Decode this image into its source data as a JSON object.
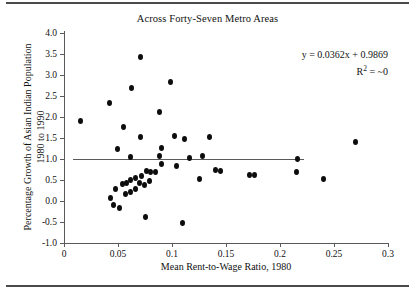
{
  "chart_data": {
    "type": "scatter",
    "title": "Across Forty-Seven Metro Areas",
    "xlabel": "Mean Rent-to-Wage Ratio, 1980",
    "ylabel_line1": "Percentage Growth of Asian Indian Population",
    "ylabel_line2": "1980 to 1990",
    "xlim": [
      0,
      0.3
    ],
    "ylim": [
      -1.0,
      4.0
    ],
    "xticks": [
      0,
      0.05,
      0.1,
      0.15,
      0.2,
      0.25,
      0.3
    ],
    "xtick_labels": [
      "0",
      "0.05",
      "0.1",
      "0.15",
      "0.2",
      "0.25",
      "0.3"
    ],
    "yticks": [
      -1.0,
      -0.5,
      0.0,
      0.5,
      1.0,
      1.5,
      2.0,
      2.5,
      3.0,
      3.5,
      4.0
    ],
    "ytick_labels": [
      "-1.0",
      "-0.5",
      "0.0",
      "0.5",
      "1.0",
      "1.5",
      "2.0",
      "2.5",
      "3.0",
      "3.5",
      "4.0"
    ],
    "grid": false,
    "legend": null,
    "marker_color": "#0d0d0d",
    "trendline_color": "#5a5a5a",
    "annotations": {
      "equation": "y = 0.0362x + 0.9869",
      "r_squared_label": "R",
      "r_squared_sup": "2",
      "r_squared_value": "= ~0"
    },
    "trendline": {
      "slope": 0.0362,
      "intercept": 0.9869,
      "x_start": 0.008,
      "x_end": 0.222
    },
    "points": [
      [
        0.015,
        1.9
      ],
      [
        0.0705,
        3.43
      ],
      [
        0.0625,
        2.68
      ],
      [
        0.0985,
        2.84
      ],
      [
        0.0425,
        2.33
      ],
      [
        0.0885,
        2.13
      ],
      [
        0.0555,
        1.77
      ],
      [
        0.1025,
        1.55
      ],
      [
        0.0705,
        1.53
      ],
      [
        0.112,
        1.48
      ],
      [
        0.1345,
        1.53
      ],
      [
        0.0495,
        1.23
      ],
      [
        0.0905,
        1.27
      ],
      [
        0.1285,
        1.07
      ],
      [
        0.1165,
        1.02
      ],
      [
        0.0885,
        1.07
      ],
      [
        0.0615,
        1.05
      ],
      [
        0.0905,
        0.88
      ],
      [
        0.1045,
        0.83
      ],
      [
        0.27,
        1.4
      ],
      [
        0.2165,
        1.0
      ],
      [
        0.2155,
        0.7
      ],
      [
        0.1715,
        0.63
      ],
      [
        0.176,
        0.62
      ],
      [
        0.2405,
        0.52
      ],
      [
        0.1405,
        0.75
      ],
      [
        0.1445,
        0.72
      ],
      [
        0.125,
        0.52
      ],
      [
        0.076,
        0.72
      ],
      [
        0.0805,
        0.7
      ],
      [
        0.0845,
        0.68
      ],
      [
        0.072,
        0.6
      ],
      [
        0.066,
        0.55
      ],
      [
        0.062,
        0.5
      ],
      [
        0.058,
        0.43
      ],
      [
        0.0545,
        0.4
      ],
      [
        0.07,
        0.42
      ],
      [
        0.0745,
        0.38
      ],
      [
        0.079,
        0.48
      ],
      [
        0.066,
        0.28
      ],
      [
        0.062,
        0.22
      ],
      [
        0.0565,
        0.17
      ],
      [
        0.048,
        0.28
      ],
      [
        0.043,
        0.07
      ],
      [
        0.0455,
        -0.1
      ],
      [
        0.051,
        -0.17
      ],
      [
        0.0755,
        -0.38
      ],
      [
        0.11,
        -0.53
      ]
    ]
  }
}
